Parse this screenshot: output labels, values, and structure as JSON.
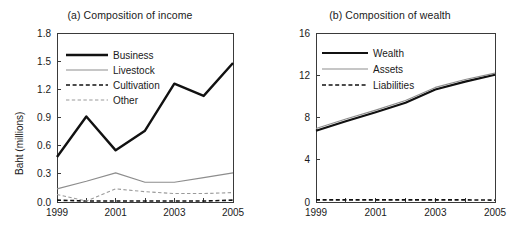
{
  "figure": {
    "axis_label": "Baht (millions)"
  },
  "panel_a": {
    "title": "(a) Composition of income",
    "ylabel": "Baht (millions)",
    "yticks": [
      "0.0",
      "0.3",
      "0.6",
      "0.9",
      "1.2",
      "1.5",
      "1.8"
    ],
    "xticks": [
      "1999",
      "2001",
      "2003",
      "2005"
    ],
    "legend": [
      "Business",
      "Livestock",
      "Cultivation",
      "Other"
    ]
  },
  "panel_b": {
    "title": "(b) Composition of wealth",
    "ylabel": "Baht (millions)",
    "yticks": [
      "0",
      "4",
      "8",
      "12",
      "16"
    ],
    "xticks": [
      "1999",
      "2001",
      "2003",
      "2005"
    ],
    "legend": [
      "Wealth",
      "Assets",
      "Liabilities"
    ]
  },
  "chart_data": [
    {
      "type": "line",
      "title": "(a) Composition of income",
      "xlabel": "",
      "ylabel": "Baht (millions)",
      "x": [
        1999,
        2000,
        2001,
        2002,
        2003,
        2004,
        2005
      ],
      "xlim": [
        1999,
        2005
      ],
      "ylim": [
        0.0,
        1.8
      ],
      "ytick_values": [
        0.0,
        0.3,
        0.6,
        0.9,
        1.2,
        1.5,
        1.8
      ],
      "xtick_values": [
        1999,
        2001,
        2003,
        2005
      ],
      "grid": false,
      "legend_position": "upper-left",
      "series": [
        {
          "name": "Business",
          "values": [
            0.48,
            0.91,
            0.55,
            0.76,
            1.26,
            1.13,
            1.48
          ],
          "color": "#111111",
          "style": "solid",
          "width": 2.4
        },
        {
          "name": "Livestock",
          "values": [
            0.14,
            0.22,
            0.31,
            0.21,
            0.21,
            0.26,
            0.31
          ],
          "color": "#8d8d8d",
          "style": "solid",
          "width": 1.1
        },
        {
          "name": "Cultivation",
          "values": [
            0.02,
            0.01,
            0.01,
            0.01,
            0.01,
            0.01,
            0.02
          ],
          "color": "#111111",
          "style": "dashed",
          "width": 1.6
        },
        {
          "name": "Other",
          "values": [
            0.08,
            0.01,
            0.14,
            0.11,
            0.09,
            0.09,
            0.1
          ],
          "color": "#9a9a9a",
          "style": "dashed",
          "width": 1.1
        }
      ]
    },
    {
      "type": "line",
      "title": "(b) Composition of wealth",
      "xlabel": "",
      "ylabel": "Baht (millions)",
      "x": [
        1999,
        2000,
        2001,
        2002,
        2003,
        2004,
        2005
      ],
      "xlim": [
        1999,
        2005
      ],
      "ylim": [
        0,
        16
      ],
      "ytick_values": [
        0,
        4,
        8,
        12,
        16
      ],
      "xtick_values": [
        1999,
        2001,
        2003,
        2005
      ],
      "grid": false,
      "legend_position": "upper-left",
      "series": [
        {
          "name": "Wealth",
          "values": [
            6.75,
            7.65,
            8.5,
            9.4,
            10.65,
            11.4,
            12.05
          ],
          "color": "#111111",
          "style": "solid",
          "width": 2.2
        },
        {
          "name": "Assets",
          "values": [
            6.95,
            7.85,
            8.7,
            9.6,
            10.85,
            11.6,
            12.2
          ],
          "color": "#8d8d8d",
          "style": "solid",
          "width": 1.1
        },
        {
          "name": "Liabilities",
          "values": [
            0.2,
            0.2,
            0.2,
            0.2,
            0.2,
            0.2,
            0.18
          ],
          "color": "#111111",
          "style": "dashed",
          "width": 1.6
        }
      ]
    }
  ]
}
